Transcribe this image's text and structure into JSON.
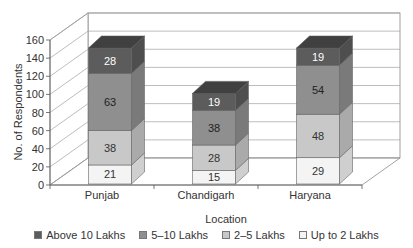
{
  "chart_data": {
    "type": "bar",
    "stacked": true,
    "three_d": true,
    "title": "",
    "xlabel": "Location",
    "ylabel": "No. of Respondents",
    "ylim": [
      0,
      160
    ],
    "yticks": [
      0,
      20,
      40,
      60,
      80,
      100,
      120,
      140,
      160
    ],
    "grid": true,
    "legend_position": "bottom",
    "categories": [
      "Punjab",
      "Chandigarh",
      "Haryana"
    ],
    "series": [
      {
        "name": "Up to 2 Lakhs",
        "values": [
          21,
          15,
          29
        ],
        "color": "#f4f4f4",
        "label_color": "#333333"
      },
      {
        "name": "2–5 Lakhs",
        "values": [
          38,
          28,
          48
        ],
        "color": "#c8c8c8",
        "label_color": "#333333"
      },
      {
        "name": "5–10 Lakhs",
        "values": [
          63,
          38,
          54
        ],
        "color": "#8f8f8f",
        "label_color": "#222222"
      },
      {
        "name": "Above 10 Lakhs",
        "values": [
          28,
          19,
          19
        ],
        "color": "#5c5c5c",
        "label_color": "#ffffff"
      }
    ],
    "legend_order": [
      "Above 10 Lakhs",
      "5–10 Lakhs",
      "2–5 Lakhs",
      "Up to 2 Lakhs"
    ]
  }
}
